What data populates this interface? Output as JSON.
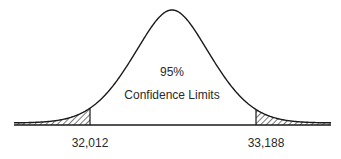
{
  "chart_data": {
    "type": "area",
    "title": "",
    "center_label": "95%",
    "center_sublabel": "Confidence Limits",
    "confidence_level": 95,
    "lower_limit": 32012,
    "upper_limit": 33188,
    "tick_labels": [
      "32,012",
      "33,188"
    ],
    "shaded_regions": [
      "left tail (< 32,012)",
      "right tail (> 33,188)"
    ],
    "xlabel": "",
    "ylabel": "",
    "grid": false,
    "legend": "none"
  },
  "labels": {
    "percent": "95%",
    "caption": "Confidence Limits",
    "lower": "32,012",
    "upper": "33,188"
  },
  "colors": {
    "line": "#1a1a1a",
    "hatch": "#333333",
    "background": "#ffffff"
  }
}
